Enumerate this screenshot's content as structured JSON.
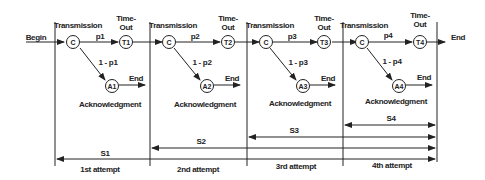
{
  "diagram": {
    "begin_label": "Begin",
    "end_label": "End",
    "ack_label": "Acknowledgment",
    "transmission_label": "Transmission",
    "timeout_label_1": "Time-",
    "timeout_label_2": "Out",
    "stages": [
      {
        "p": "p1",
        "q": "1 - p1",
        "c": "C",
        "t": "T1",
        "a": "A1",
        "attempt": "1st attempt",
        "s": "S1"
      },
      {
        "p": "p2",
        "q": "1 - p2",
        "c": "C",
        "t": "T2",
        "a": "A2",
        "attempt": "2nd attempt",
        "s": "S2"
      },
      {
        "p": "p3",
        "q": "1 - p3",
        "c": "C",
        "t": "T3",
        "a": "A3",
        "attempt": "3rd attempt",
        "s": "S3"
      },
      {
        "p": "p4",
        "q": "1 - p4",
        "c": "C",
        "t": "T4",
        "a": "A4",
        "attempt": "4th attempt",
        "s": "S4"
      }
    ]
  }
}
